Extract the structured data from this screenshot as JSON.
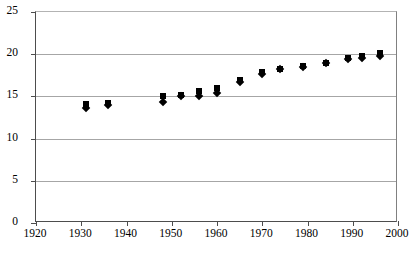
{
  "chart_data": {
    "type": "scatter",
    "title": "",
    "subtitle": "",
    "xlabel": "",
    "ylabel": "",
    "xlim": [
      1920,
      2000
    ],
    "ylim": [
      0,
      25
    ],
    "xticks": [
      1920,
      1930,
      1940,
      1950,
      1960,
      1970,
      1980,
      1990,
      2000
    ],
    "yticks": [
      0,
      5,
      10,
      15,
      20,
      25
    ],
    "grid": "horizontal",
    "legend_position": "none",
    "legend": [],
    "annotations": [],
    "series": [
      {
        "name": "series-square",
        "marker": "square",
        "color": "#000000",
        "points": [
          {
            "x": 1931,
            "y": 14.1
          },
          {
            "x": 1936,
            "y": 14.2
          },
          {
            "x": 1948,
            "y": 15.1
          },
          {
            "x": 1952,
            "y": 15.2
          },
          {
            "x": 1956,
            "y": 15.6
          },
          {
            "x": 1960,
            "y": 16.0
          },
          {
            "x": 1965,
            "y": 16.9
          },
          {
            "x": 1970,
            "y": 17.9
          },
          {
            "x": 1974,
            "y": 18.3
          },
          {
            "x": 1979,
            "y": 18.6
          },
          {
            "x": 1984,
            "y": 19.0
          },
          {
            "x": 1989,
            "y": 19.6
          },
          {
            "x": 1992,
            "y": 19.8
          },
          {
            "x": 1996,
            "y": 20.2
          }
        ]
      },
      {
        "name": "series-diamond",
        "marker": "diamond",
        "color": "#000000",
        "points": [
          {
            "x": 1931,
            "y": 13.6
          },
          {
            "x": 1936,
            "y": 14.0
          },
          {
            "x": 1948,
            "y": 14.3
          },
          {
            "x": 1952,
            "y": 15.0
          },
          {
            "x": 1956,
            "y": 15.1
          },
          {
            "x": 1960,
            "y": 15.4
          },
          {
            "x": 1965,
            "y": 16.7
          },
          {
            "x": 1970,
            "y": 17.6
          },
          {
            "x": 1974,
            "y": 18.2
          },
          {
            "x": 1979,
            "y": 18.5
          },
          {
            "x": 1984,
            "y": 18.9
          },
          {
            "x": 1989,
            "y": 19.4
          },
          {
            "x": 1992,
            "y": 19.5
          },
          {
            "x": 1996,
            "y": 19.8
          }
        ]
      }
    ]
  }
}
